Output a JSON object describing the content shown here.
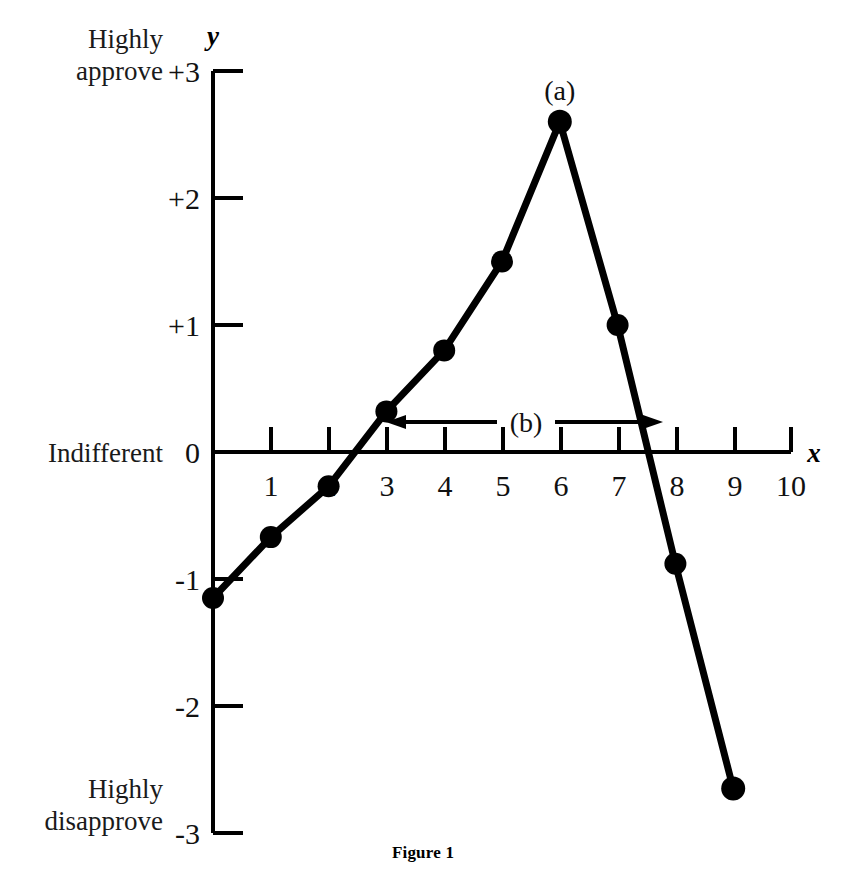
{
  "figure": {
    "caption": "Figure 1"
  },
  "axes": {
    "x_axis_name": "x",
    "y_axis_name": "y",
    "x_ticks": [
      "1",
      "2",
      "3",
      "4",
      "5",
      "6",
      "7",
      "8",
      "9",
      "10"
    ],
    "y_ticks": [
      "+3",
      "+2",
      "+1",
      "0",
      "-1",
      "-2",
      "-3"
    ],
    "y_scale_labels": [
      {
        "value": "+3",
        "line1": "Highly",
        "line2": "approve"
      },
      {
        "value": "0",
        "line1": "Indifferent",
        "line2": ""
      },
      {
        "value": "-3",
        "line1": "Highly",
        "line2": "disapprove"
      }
    ]
  },
  "annotations": [
    {
      "id": "a",
      "label": "(a)",
      "at_x": 6,
      "at_y": 2.6
    },
    {
      "id": "b",
      "label": "(b)",
      "from_x": 3,
      "to_x": 7.7,
      "at_y": 0.25
    }
  ],
  "chart_data": {
    "type": "line",
    "title": "Figure 1",
    "xlabel": "x",
    "ylabel": "y",
    "xlim": [
      0,
      10
    ],
    "ylim": [
      -3,
      3
    ],
    "grid": false,
    "legend": "none",
    "markers": "filled-circle",
    "x": [
      0,
      1,
      2,
      3,
      4,
      5,
      6,
      7,
      8,
      9
    ],
    "y": [
      -1.15,
      -0.67,
      -0.27,
      0.32,
      0.8,
      1.5,
      2.6,
      1.0,
      -0.88,
      -2.65
    ],
    "series": [
      {
        "name": "approval",
        "values": [
          -1.15,
          -0.67,
          -0.27,
          0.32,
          0.8,
          1.5,
          2.6,
          1.0,
          -0.88,
          -2.65
        ]
      }
    ],
    "y_tick_values": [
      3,
      2,
      1,
      0,
      -1,
      -2,
      -3
    ],
    "y_tick_labels": [
      "+3",
      "+2",
      "+1",
      "0",
      "-1",
      "-2",
      "-3"
    ],
    "x_tick_values": [
      1,
      2,
      3,
      4,
      5,
      6,
      7,
      8,
      9,
      10
    ],
    "x_tick_labels": [
      "1",
      "2",
      "3",
      "4",
      "5",
      "6",
      "7",
      "8",
      "9",
      "10"
    ],
    "y_axis_anchor_labels": {
      "top": "Highly approve",
      "middle": "Indifferent",
      "bottom": "Highly disapprove"
    },
    "annotations": [
      {
        "text": "(a)",
        "x": 6,
        "y": 2.6,
        "kind": "point-callout"
      },
      {
        "text": "(b)",
        "x_start": 3,
        "x_end": 7.7,
        "y": 0.25,
        "kind": "double-arrow-span"
      }
    ]
  }
}
